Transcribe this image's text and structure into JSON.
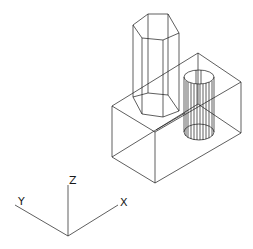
{
  "drawing": {
    "type": "isometric wireframe",
    "objects": [
      "rectangular box",
      "hexagonal prism",
      "cylinder"
    ],
    "line_color": "#1a1a1a",
    "background": "#ffffff"
  },
  "axes": {
    "x_label": "X",
    "y_label": "Y",
    "z_label": "Z"
  }
}
